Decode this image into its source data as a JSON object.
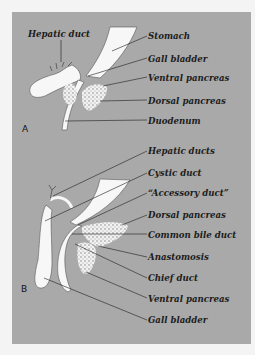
{
  "figure": {
    "panel_a": {
      "letter": "A",
      "labels": {
        "hepatic_duct": "Hepatic duct",
        "stomach": "Stomach",
        "gall_bladder": "Gall bladder",
        "ventral_pancreas": "Ventral pancreas",
        "dorsal_pancreas": "Dorsal pancreas",
        "duodenum": "Duodenum"
      }
    },
    "panel_b": {
      "letter": "B",
      "labels": {
        "hepatic_ducts": "Hepatic ducts",
        "cystic_duct": "Cystic duct",
        "accessory_duct": "“Accessory duct”",
        "dorsal_pancreas": "Dorsal pancreas",
        "common_bile_duct": "Common bile duct",
        "anastomosis": "Anastomosis",
        "chief_duct": "Chief duct",
        "ventral_pancreas": "Ventral pancreas",
        "gall_bladder": "Gall bladder"
      }
    },
    "colors": {
      "background": "#a9a9a9",
      "organ_fill": "#f7f7f7",
      "leader_line": "#1c1c1c"
    }
  }
}
